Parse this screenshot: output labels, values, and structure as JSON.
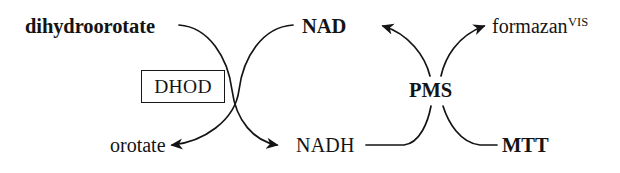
{
  "diagram": {
    "background_color": "#ffffff",
    "ink_color": "#141414",
    "nodes": {
      "dihydroorotate": "dihydroorotate",
      "orotate": "orotate",
      "enzyme": "DHOD",
      "nad": "NAD",
      "nadh": "NADH",
      "pms": "PMS",
      "mtt": "MTT",
      "formazan": "formazan",
      "formazan_superscript": "VIS"
    },
    "edges": [
      {
        "name": "dihydroorotate-to-nadh",
        "from": "dihydroorotate",
        "to": "NADH",
        "arrowhead": "to-nadh",
        "direction": "down-right"
      },
      {
        "name": "nad-to-orotate",
        "from": "NAD",
        "to": "orotate",
        "arrowhead": "to-orotate",
        "direction": "down-left"
      },
      {
        "name": "nadh-to-formazan",
        "from": "NADH",
        "to": "formazan",
        "arrowhead": "to-formazan",
        "direction": "up-right"
      },
      {
        "name": "mtt-to-nad",
        "from": "MTT",
        "to": "NAD",
        "arrowhead": "to-nad",
        "direction": "up-left"
      }
    ],
    "catalysts": [
      "DHOD",
      "PMS"
    ]
  }
}
